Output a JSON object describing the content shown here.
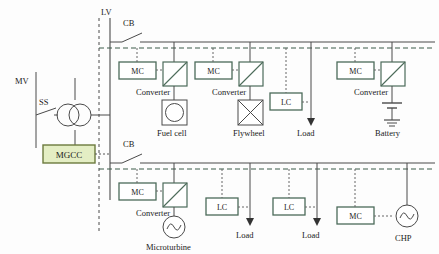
{
  "figure": {
    "type": "microgrid-single-line-diagram",
    "colors": {
      "line": "#4a4a4a",
      "box_stroke": "#4c6b5a",
      "mgcc_fill": "#e4eec4",
      "mgcc_stroke": "#6c7a3e",
      "comm_dash": "#3d5c4a",
      "background": "#fdfdfd"
    }
  },
  "labels": {
    "mv": "MV",
    "lv": "LV",
    "ss": "SS",
    "cb_upper": "CB",
    "cb_lower": "CB",
    "mgcc": "MGCC"
  },
  "upper_feeder": {
    "units": [
      {
        "controller": "MC",
        "converter_label": "Converter",
        "source_label": "Fuel cell",
        "source_icon": "fuel-cell-icon"
      },
      {
        "controller": "MC",
        "converter_label": "Converter",
        "source_label": "Flywheel",
        "source_icon": "flywheel-icon"
      },
      {
        "controller": "LC",
        "source_label": "Load",
        "source_icon": "load-arrow-icon"
      },
      {
        "controller": "MC",
        "converter_label": "Converter",
        "source_label": "Battery",
        "source_icon": "battery-icon"
      }
    ]
  },
  "lower_feeder": {
    "units": [
      {
        "controller": "MC",
        "converter_label": "Converter",
        "source_label": "Microturbine",
        "source_icon": "ac-source-icon"
      },
      {
        "controller": "LC",
        "source_label": "Load",
        "source_icon": "load-arrow-icon"
      },
      {
        "controller": "LC",
        "source_label": "Load",
        "source_icon": "load-arrow-icon"
      },
      {
        "controller": "MC",
        "source_label": "CHP",
        "source_icon": "ac-source-icon"
      }
    ]
  }
}
